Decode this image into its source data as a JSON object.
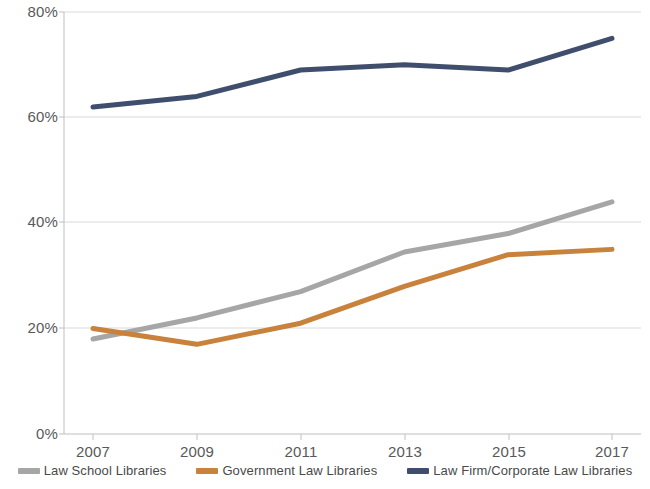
{
  "chart_data": {
    "type": "line",
    "title": "",
    "xlabel": "",
    "ylabel": "",
    "categories": [
      "2007",
      "2009",
      "2011",
      "2013",
      "2015",
      "2017"
    ],
    "x": [
      2007,
      2009,
      2011,
      2013,
      2015,
      2017
    ],
    "ylim": [
      0,
      80
    ],
    "ytick_labels": [
      "0%",
      "20%",
      "40%",
      "60%",
      "80%"
    ],
    "ytick_values": [
      0,
      20,
      40,
      60,
      80
    ],
    "grid": true,
    "grid_axis": "y",
    "legend_position": "bottom",
    "value_format": "percent",
    "series": [
      {
        "name": "Law School Libraries",
        "color": "#a6a6a6",
        "values": [
          18,
          22,
          27,
          34.5,
          38,
          44
        ]
      },
      {
        "name": "Government Law Libraries",
        "color": "#c8823c",
        "values": [
          20,
          17,
          21,
          28,
          34,
          35
        ]
      },
      {
        "name": "Law Firm/Corporate Law Libraries",
        "color": "#404e6e",
        "values": [
          62,
          64,
          69,
          70,
          69,
          75
        ]
      }
    ]
  },
  "axes": {
    "y_ticks": [
      {
        "label": "80%"
      },
      {
        "label": "60%"
      },
      {
        "label": "40%"
      },
      {
        "label": "20%"
      },
      {
        "label": "0%"
      }
    ],
    "x_ticks": [
      {
        "label": "2007"
      },
      {
        "label": "2009"
      },
      {
        "label": "2011"
      },
      {
        "label": "2013"
      },
      {
        "label": "2015"
      },
      {
        "label": "2017"
      }
    ]
  },
  "legend": {
    "items": [
      {
        "label": "Law School Libraries",
        "color": "#a6a6a6"
      },
      {
        "label": "Government Law Libraries",
        "color": "#c8823c"
      },
      {
        "label": "Law Firm/Corporate Law Libraries",
        "color": "#404e6e"
      }
    ]
  }
}
